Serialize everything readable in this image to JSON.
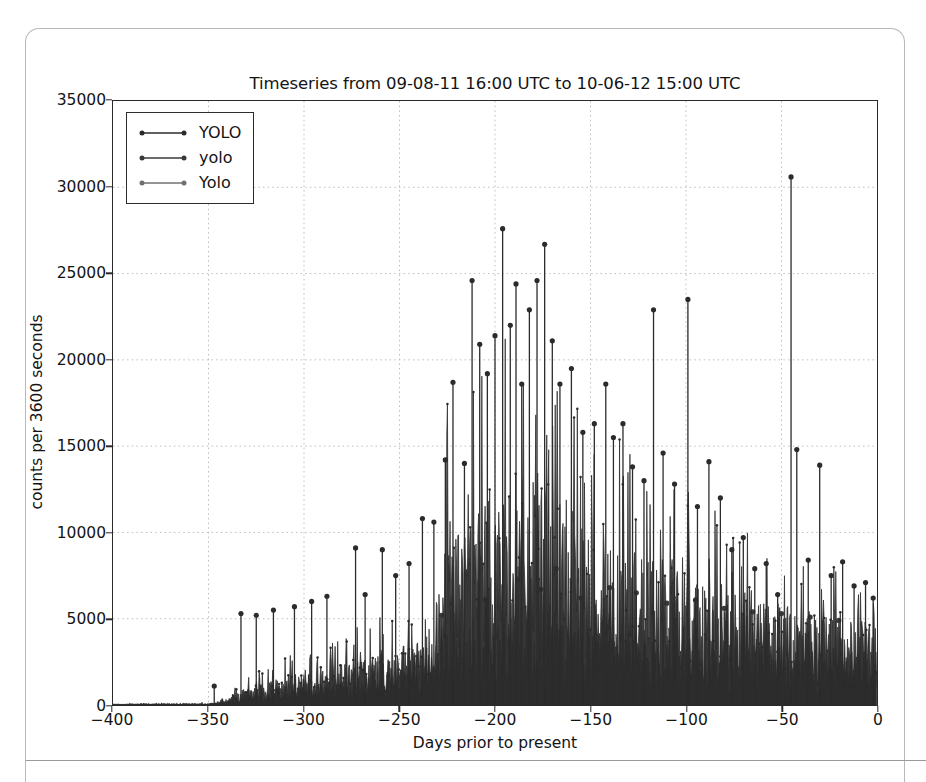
{
  "figure": {
    "title": "Timeseries from 09-08-11 16:00 UTC to 10-06-12 15:00 UTC",
    "xlabel": "Days prior to present",
    "ylabel": "counts per 3600 seconds"
  },
  "legend": {
    "items": [
      {
        "label": "YOLO",
        "color": "#2b2b2b"
      },
      {
        "label": "yolo",
        "color": "#3a3a3a"
      },
      {
        "label": "Yolo",
        "color": "#707070"
      }
    ]
  },
  "chart_data": {
    "type": "line",
    "title": "Timeseries from 09-08-11 16:00 UTC to 10-06-12 15:00 UTC",
    "xlabel": "Days prior to present",
    "ylabel": "counts per 3600 seconds",
    "xlim": [
      -400,
      0
    ],
    "ylim": [
      0,
      35000
    ],
    "xticks": [
      -400,
      -350,
      -300,
      -250,
      -200,
      -150,
      -100,
      -50,
      0
    ],
    "yticks": [
      0,
      5000,
      10000,
      15000,
      20000,
      25000,
      30000,
      35000
    ],
    "grid": true,
    "grid_style": "dotted",
    "legend_position": "upper left",
    "marker": "dot",
    "series": [
      {
        "name": "YOLO",
        "color": "#2b2b2b",
        "description": "Dense spiky hourly counts; near zero from -400 to -345, rising envelope peaking around -190 to -170, gradual decline toward 0 with isolated tall spikes.",
        "envelope_x": [
          -400,
          -380,
          -360,
          -350,
          -345,
          -340,
          -330,
          -320,
          -310,
          -300,
          -290,
          -280,
          -270,
          -260,
          -250,
          -240,
          -230,
          -225,
          -215,
          -205,
          -195,
          -190,
          -185,
          -180,
          -175,
          -170,
          -160,
          -150,
          -140,
          -130,
          -120,
          -110,
          -100,
          -90,
          -80,
          -70,
          -60,
          -50,
          -45,
          -40,
          -30,
          -20,
          -10,
          0
        ],
        "envelope_baseline": [
          60,
          70,
          80,
          90,
          120,
          400,
          900,
          1200,
          1500,
          1800,
          2000,
          2200,
          2500,
          2800,
          3000,
          3200,
          3600,
          9800,
          10200,
          11000,
          11500,
          12000,
          11800,
          11500,
          12500,
          11000,
          9500,
          8800,
          8500,
          8200,
          8000,
          7600,
          7200,
          6800,
          6200,
          5800,
          5400,
          5200,
          5000,
          4800,
          4600,
          4400,
          4200,
          4000
        ],
        "peaks": [
          {
            "x": -347,
            "y": 1100
          },
          {
            "x": -333,
            "y": 5300
          },
          {
            "x": -325,
            "y": 5200
          },
          {
            "x": -316,
            "y": 5500
          },
          {
            "x": -305,
            "y": 5700
          },
          {
            "x": -296,
            "y": 6000
          },
          {
            "x": -288,
            "y": 6300
          },
          {
            "x": -273,
            "y": 9100
          },
          {
            "x": -268,
            "y": 6400
          },
          {
            "x": -259,
            "y": 9000
          },
          {
            "x": -252,
            "y": 7500
          },
          {
            "x": -245,
            "y": 8200
          },
          {
            "x": -238,
            "y": 10800
          },
          {
            "x": -232,
            "y": 10600
          },
          {
            "x": -226,
            "y": 14200
          },
          {
            "x": -222,
            "y": 18700
          },
          {
            "x": -216,
            "y": 14000
          },
          {
            "x": -212,
            "y": 24600
          },
          {
            "x": -208,
            "y": 20900
          },
          {
            "x": -204,
            "y": 19200
          },
          {
            "x": -200,
            "y": 21400
          },
          {
            "x": -196,
            "y": 27600
          },
          {
            "x": -192,
            "y": 22000
          },
          {
            "x": -189,
            "y": 24400
          },
          {
            "x": -186,
            "y": 18600
          },
          {
            "x": -182,
            "y": 22900
          },
          {
            "x": -178,
            "y": 24600
          },
          {
            "x": -174,
            "y": 26700
          },
          {
            "x": -170,
            "y": 21100
          },
          {
            "x": -166,
            "y": 18600
          },
          {
            "x": -160,
            "y": 19500
          },
          {
            "x": -154,
            "y": 15800
          },
          {
            "x": -148,
            "y": 16300
          },
          {
            "x": -142,
            "y": 18600
          },
          {
            "x": -138,
            "y": 15500
          },
          {
            "x": -133,
            "y": 16300
          },
          {
            "x": -128,
            "y": 13800
          },
          {
            "x": -122,
            "y": 13000
          },
          {
            "x": -117,
            "y": 22900
          },
          {
            "x": -112,
            "y": 14600
          },
          {
            "x": -106,
            "y": 12800
          },
          {
            "x": -99,
            "y": 23500
          },
          {
            "x": -94,
            "y": 11500
          },
          {
            "x": -88,
            "y": 14100
          },
          {
            "x": -82,
            "y": 12000
          },
          {
            "x": -76,
            "y": 9000
          },
          {
            "x": -70,
            "y": 9700
          },
          {
            "x": -64,
            "y": 7900
          },
          {
            "x": -58,
            "y": 8200
          },
          {
            "x": -52,
            "y": 6400
          },
          {
            "x": -45,
            "y": 30600
          },
          {
            "x": -42,
            "y": 14800
          },
          {
            "x": -36,
            "y": 8400
          },
          {
            "x": -30,
            "y": 13900
          },
          {
            "x": -24,
            "y": 7500
          },
          {
            "x": -18,
            "y": 8300
          },
          {
            "x": -12,
            "y": 6900
          },
          {
            "x": -6,
            "y": 7100
          },
          {
            "x": -2,
            "y": 6200
          }
        ]
      },
      {
        "name": "yolo",
        "color": "#3a3a3a",
        "description": "Mid-level series tracking roughly 35-50% of the YOLO envelope with its own spikes up to ~8000.",
        "envelope_x": [
          -400,
          -350,
          -340,
          -320,
          -300,
          -280,
          -260,
          -240,
          -225,
          -210,
          -195,
          -180,
          -165,
          -150,
          -135,
          -120,
          -105,
          -90,
          -75,
          -60,
          -45,
          -30,
          -15,
          0
        ],
        "envelope_baseline": [
          40,
          60,
          300,
          700,
          1000,
          1300,
          1600,
          1900,
          3600,
          4200,
          4600,
          4400,
          4100,
          3900,
          3800,
          3700,
          3500,
          3400,
          3300,
          3200,
          3100,
          3000,
          2900,
          2800
        ],
        "peaks": [
          {
            "x": -228,
            "y": 5200
          },
          {
            "x": -205,
            "y": 6100
          },
          {
            "x": -188,
            "y": 7300
          },
          {
            "x": -176,
            "y": 6700
          },
          {
            "x": -168,
            "y": 7900
          },
          {
            "x": -155,
            "y": 6200
          },
          {
            "x": -140,
            "y": 6800
          },
          {
            "x": -126,
            "y": 6500
          },
          {
            "x": -110,
            "y": 5900
          },
          {
            "x": -95,
            "y": 6100
          },
          {
            "x": -80,
            "y": 5600
          },
          {
            "x": -65,
            "y": 5400
          },
          {
            "x": -50,
            "y": 5300
          },
          {
            "x": -35,
            "y": 5100
          },
          {
            "x": -20,
            "y": 4900
          }
        ]
      },
      {
        "name": "Yolo",
        "color": "#707070",
        "description": "Low-level grey band near the baseline, roughly 300-1200 counts across the active window.",
        "envelope_x": [
          -400,
          -350,
          -340,
          -320,
          -300,
          -280,
          -250,
          -225,
          -200,
          -175,
          -150,
          -125,
          -100,
          -75,
          -50,
          -25,
          0
        ],
        "envelope_baseline": [
          20,
          30,
          120,
          300,
          420,
          520,
          620,
          900,
          1050,
          1100,
          1000,
          950,
          900,
          820,
          760,
          700,
          660
        ],
        "peaks": []
      }
    ]
  }
}
